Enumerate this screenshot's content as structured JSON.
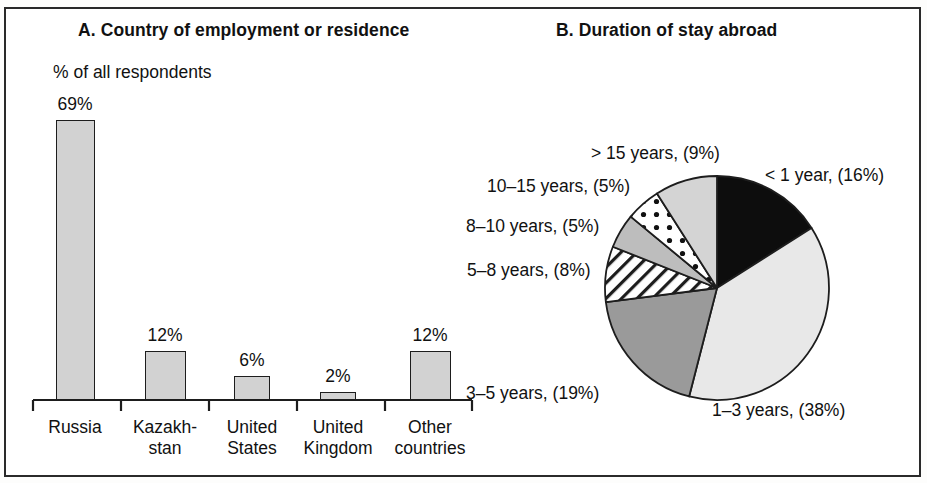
{
  "figure": {
    "panel_a_title": "A. Country of employment or residence",
    "panel_b_title": "B. Duration of stay abroad"
  },
  "chart_data": [
    {
      "type": "bar",
      "panel": "A",
      "title": "A. Country of employment or residence",
      "ylabel": "% of all respondents",
      "xlabel": "",
      "ylim": [
        0,
        75
      ],
      "grid": false,
      "legend": "none",
      "categories": [
        "Russia",
        "Kazakh-\nstan",
        "United\nStates",
        "United\nKingdom",
        "Other\ncountries"
      ],
      "category_lines": [
        [
          "Russia"
        ],
        [
          "Kazakh-",
          "stan"
        ],
        [
          "United",
          "States"
        ],
        [
          "United",
          "Kingdom"
        ],
        [
          "Other",
          "countries"
        ]
      ],
      "values": [
        69,
        12,
        6,
        2,
        12
      ],
      "value_labels": [
        "69%",
        "12%",
        "6%",
        "2%",
        "12%"
      ],
      "bar_fill": "#d2d2d2",
      "bar_stroke": "#1d1d1d"
    },
    {
      "type": "pie",
      "panel": "B",
      "title": "B. Duration of stay abroad",
      "legend": "callout-labels",
      "start_angle_deg": 0,
      "direction": "clockwise",
      "labels": [
        "< 1 year, (16%)",
        "1–3 years, (38%)",
        "3–5 years, (19%)",
        "5–8 years, (8%)",
        "8–10 years, (5%)",
        "10–15 years, (5%)",
        "> 15 years, (9%)"
      ],
      "categories": [
        "< 1 year",
        "1–3 years",
        "3–5 years",
        "5–8 years",
        "8–10 years",
        "10–15 years",
        "> 15 years"
      ],
      "values": [
        16,
        38,
        19,
        8,
        5,
        5,
        9
      ],
      "slice_styles": [
        "solid-black",
        "solid-very-light-gray",
        "solid-dark-gray",
        "white-diagonal-hatch",
        "solid-medium-gray",
        "white-dotted",
        "solid-light-gray"
      ],
      "slice_colors": [
        "#0d0d0d",
        "#e8e8e8",
        "#9a9a9a",
        "#ffffff",
        "#bdbdbd",
        "#ffffff",
        "#d4d4d4"
      ]
    }
  ]
}
